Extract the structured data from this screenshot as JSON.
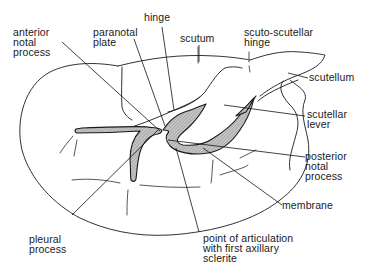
{
  "diagram": {
    "labels": {
      "anterior_notal_process": "anterior\nnotal\nprocess",
      "paranotal_plate": "paranotal\nplate",
      "hinge": "hinge",
      "scutum": "scutum",
      "scuto_scutellar_hinge": "scuto-scutellar\nhinge",
      "scutellum": "scutellum",
      "scutellar_lever": "scutellar\nlever",
      "posterior_notal_process": "posterior\nnotal\nprocess",
      "membrane": "membrane",
      "pleural_process": "pleural\nprocess",
      "point_of_articulation": "point of articulation\nwith first axillary\nsclerite"
    },
    "colors": {
      "line": "#1a1a1a",
      "sclerite_fill": "#bdbdbd",
      "background": "#ffffff"
    }
  }
}
